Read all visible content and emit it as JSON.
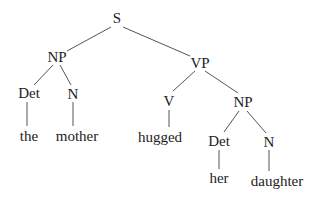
{
  "tree": {
    "nodes": {
      "s": {
        "label": "S",
        "x": 117,
        "y": 18
      },
      "np1": {
        "label": "NP",
        "x": 57,
        "y": 57
      },
      "vp": {
        "label": "VP",
        "x": 200,
        "y": 63
      },
      "det1": {
        "label": "Det",
        "x": 29,
        "y": 93
      },
      "n1": {
        "label": "N",
        "x": 73,
        "y": 94
      },
      "the": {
        "label": "the",
        "x": 29,
        "y": 136
      },
      "mother": {
        "label": "mother",
        "x": 77,
        "y": 136
      },
      "v": {
        "label": "V",
        "x": 169,
        "y": 101
      },
      "np2": {
        "label": "NP",
        "x": 243,
        "y": 102
      },
      "hugged": {
        "label": "hugged",
        "x": 160,
        "y": 137
      },
      "det2": {
        "label": "Det",
        "x": 219,
        "y": 141
      },
      "n2": {
        "label": "N",
        "x": 269,
        "y": 142
      },
      "her": {
        "label": "her",
        "x": 219,
        "y": 178
      },
      "daughter": {
        "label": "daughter",
        "x": 277,
        "y": 181
      }
    },
    "edges": [
      [
        "s",
        "np1"
      ],
      [
        "s",
        "vp"
      ],
      [
        "np1",
        "det1"
      ],
      [
        "np1",
        "n1"
      ],
      [
        "det1",
        "the"
      ],
      [
        "n1",
        "mother"
      ],
      [
        "vp",
        "v"
      ],
      [
        "vp",
        "np2"
      ],
      [
        "v",
        "hugged"
      ],
      [
        "np2",
        "det2"
      ],
      [
        "np2",
        "n2"
      ],
      [
        "det2",
        "her"
      ],
      [
        "n2",
        "daughter"
      ]
    ],
    "line_color": "#555555"
  }
}
